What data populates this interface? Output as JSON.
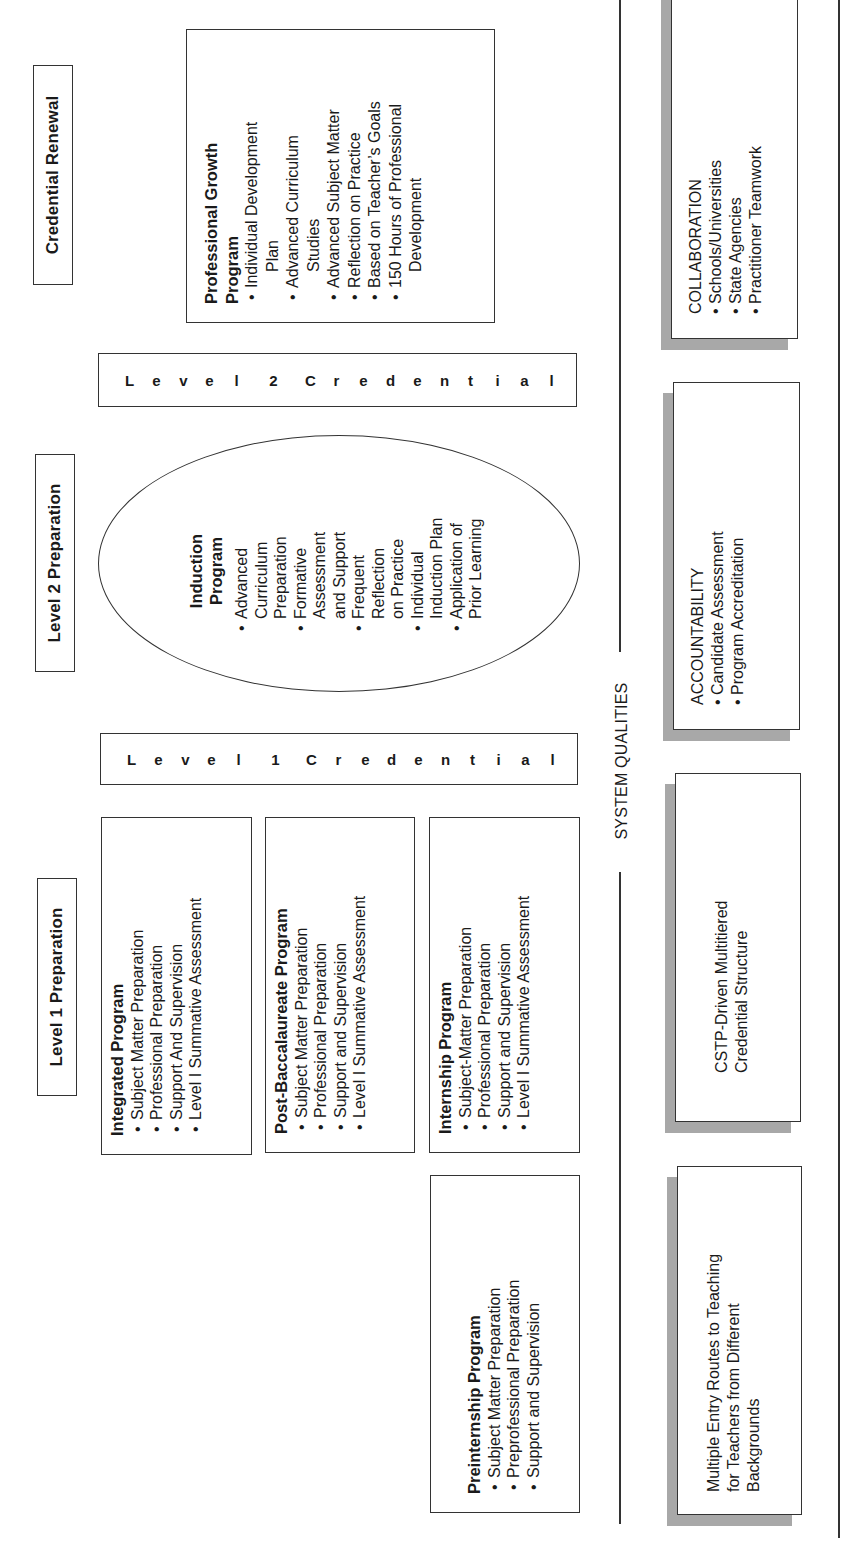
{
  "headers": {
    "level1": "Level 1 Preparation",
    "level2": "Level 2 Preparation",
    "renewal": "Credential Renewal"
  },
  "credential_bars": {
    "level1": [
      "L",
      "e",
      "v",
      "e",
      "l",
      " ",
      "1",
      " ",
      "C",
      "r",
      "e",
      "d",
      "e",
      "n",
      "t",
      "i",
      "a",
      "l"
    ],
    "level2": [
      "L",
      "e",
      "v",
      "e",
      "l",
      " ",
      "2",
      " ",
      "C",
      "r",
      "e",
      "d",
      "e",
      "n",
      "t",
      "i",
      "a",
      "l"
    ]
  },
  "programs": {
    "integrated": {
      "title": "Integrated Program",
      "items": [
        "Subject Matter Preparation",
        "Professional Preparation",
        "Support And Supervision",
        "Level I Summative Assessment"
      ]
    },
    "post_bacc": {
      "title": "Post-Baccalaureate Program",
      "items": [
        "Subject Matter Preparation",
        "Professional Preparation",
        "Support and Supervision",
        "Level I Summative Assessment"
      ]
    },
    "internship": {
      "title": "Internship Program",
      "items": [
        "Subject-Matter Preparation",
        "Professional Preparation",
        "Support and Supervision",
        "Level I Summative Assessment"
      ]
    },
    "preinternship": {
      "title": "Preinternship Program",
      "items": [
        "Subject Matter Preparation",
        "Preprofessional Preparation",
        "Support and Supervision"
      ]
    },
    "induction": {
      "title_line1": "Induction",
      "title_line2": "Program",
      "items": [
        [
          "Advanced",
          "Curriculum",
          "Preparation"
        ],
        [
          "Formative",
          "Assessment",
          "and Support"
        ],
        [
          "Frequent",
          "Reflection",
          "on Practice"
        ],
        [
          "Individual",
          "Induction Plan"
        ],
        [
          "Application of",
          "Prior Learning"
        ]
      ]
    },
    "professional_growth": {
      "title_line1": "Professional Growth",
      "title_line2": "Program",
      "items": [
        [
          "Individual Development",
          "Plan"
        ],
        [
          "Advanced Curriculum",
          "Studies"
        ],
        [
          "Advanced Subject Matter"
        ],
        [
          "Reflection on Practice"
        ],
        [
          "Based on Teacher’s Goals"
        ],
        [
          "150 Hours of Professional",
          "Development"
        ]
      ]
    }
  },
  "system_qualities": {
    "label": "SYSTEM QUALITIES",
    "boxes": {
      "multiple_entry": {
        "lines": [
          "Multiple Entry Routes to Teaching",
          "for Teachers from Different",
          "Backgrounds"
        ]
      },
      "cstp": {
        "lines": [
          "CSTP-Driven Multitiered",
          "Credential Structure"
        ]
      },
      "accountability": {
        "title": "ACCOUNTABILITY",
        "items": [
          "Candidate Assessment",
          "Program Accreditation"
        ]
      },
      "collaboration": {
        "title": "COLLABORATION",
        "items": [
          "Schools/Universities",
          "State Agencies",
          "Practitioner Teamwork"
        ]
      }
    }
  },
  "colors": {
    "border": "#333333",
    "shadow": "#a8a8a8",
    "background": "#ffffff",
    "text": "#1a1a1a"
  }
}
